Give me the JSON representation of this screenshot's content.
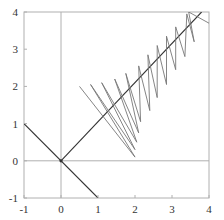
{
  "chart_data": {
    "type": "line",
    "title": "",
    "xlabel": "",
    "ylabel": "",
    "xlim": [
      -1,
      4
    ],
    "ylim": [
      -1,
      4
    ],
    "grid": false,
    "legend": null,
    "x_ticks": [
      "-1",
      "0",
      "1",
      "2",
      "3",
      "4"
    ],
    "y_ticks": [
      "-1",
      "0",
      "1",
      "2",
      "3",
      "4"
    ],
    "reference_lines": [
      {
        "name": "x-axis",
        "points": [
          [
            -1,
            0
          ],
          [
            4,
            0
          ]
        ]
      },
      {
        "name": "y-axis",
        "points": [
          [
            0,
            -1
          ],
          [
            0,
            4
          ]
        ]
      }
    ],
    "series": [
      {
        "name": "line-negative-diagonal",
        "points": [
          [
            -1,
            1
          ],
          [
            1,
            -1
          ]
        ]
      },
      {
        "name": "line-diagonal",
        "points": [
          [
            0,
            0
          ],
          [
            3.8,
            4
          ]
        ]
      },
      {
        "name": "zigzag",
        "points": [
          [
            0.5,
            2.0
          ],
          [
            2.0,
            0.1
          ],
          [
            0.8,
            2.05
          ],
          [
            2.0,
            0.3
          ],
          [
            1.1,
            2.1
          ],
          [
            2.05,
            0.5
          ],
          [
            1.45,
            2.2
          ],
          [
            2.1,
            0.75
          ],
          [
            1.75,
            2.35
          ],
          [
            2.15,
            1.05
          ],
          [
            2.1,
            2.55
          ],
          [
            2.4,
            1.35
          ],
          [
            2.35,
            2.85
          ],
          [
            2.6,
            1.7
          ],
          [
            2.6,
            3.1
          ],
          [
            2.85,
            2.05
          ],
          [
            2.85,
            3.35
          ],
          [
            3.1,
            2.45
          ],
          [
            3.1,
            3.6
          ],
          [
            3.35,
            2.8
          ],
          [
            3.4,
            3.95
          ],
          [
            3.6,
            3.2
          ],
          [
            3.45,
            4.0
          ],
          [
            4.0,
            3.7
          ]
        ]
      }
    ]
  },
  "colors": {
    "frame": "#b0b0b0",
    "axes": "#b0b0b0",
    "diagonal": "#333333",
    "zigzag": "#777777",
    "text": "#333333"
  }
}
